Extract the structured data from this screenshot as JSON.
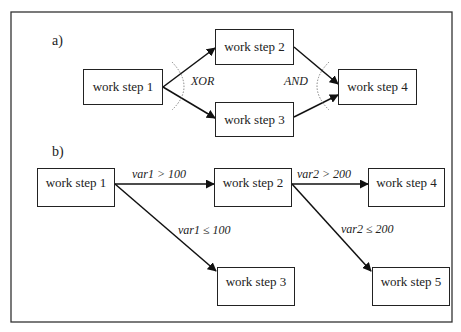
{
  "diagram": {
    "part_a": {
      "label": "a)",
      "nodes": [
        {
          "id": "a1",
          "label": "work step 1"
        },
        {
          "id": "a2",
          "label": "work step 2"
        },
        {
          "id": "a3",
          "label": "work step 3"
        },
        {
          "id": "a4",
          "label": "work step 4"
        }
      ],
      "split_label": "XOR",
      "join_label": "AND",
      "edges": [
        {
          "from": "a1",
          "to": "a2"
        },
        {
          "from": "a1",
          "to": "a3"
        },
        {
          "from": "a2",
          "to": "a4"
        },
        {
          "from": "a3",
          "to": "a4"
        }
      ]
    },
    "part_b": {
      "label": "b)",
      "nodes": [
        {
          "id": "b1",
          "label": "work step 1"
        },
        {
          "id": "b2",
          "label": "work step 2"
        },
        {
          "id": "b3",
          "label": "work step 3"
        },
        {
          "id": "b4",
          "label": "work step 4"
        },
        {
          "id": "b5",
          "label": "work step 5"
        }
      ],
      "edges": [
        {
          "from": "b1",
          "to": "b2",
          "condition": "var1 > 100"
        },
        {
          "from": "b1",
          "to": "b3",
          "condition": "var1 ≤ 100"
        },
        {
          "from": "b2",
          "to": "b4",
          "condition": "var2 > 200"
        },
        {
          "from": "b2",
          "to": "b5",
          "condition": "var2 ≤ 200"
        }
      ]
    }
  }
}
